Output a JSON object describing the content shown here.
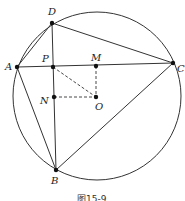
{
  "figure": {
    "caption": "图15-9",
    "circle": {
      "center": "O",
      "cx": 97,
      "cy": 96,
      "r": 84
    },
    "points": {
      "D": {
        "label": "D",
        "x": 52,
        "y": 23
      },
      "A": {
        "label": "A",
        "x": 17,
        "y": 67
      },
      "P": {
        "label": "P",
        "x": 53,
        "y": 67
      },
      "M": {
        "label": "M",
        "x": 96,
        "y": 66
      },
      "C": {
        "label": "C",
        "x": 173,
        "y": 63
      },
      "N": {
        "label": "N",
        "x": 54,
        "y": 97
      },
      "O": {
        "label": "O",
        "x": 96,
        "y": 97
      },
      "B": {
        "label": "B",
        "x": 56,
        "y": 170
      }
    },
    "solid_segments": [
      "AD",
      "DC",
      "AC",
      "DB",
      "AB",
      "BC"
    ],
    "dashed_segments": [
      "PO",
      "MO",
      "NO"
    ]
  }
}
